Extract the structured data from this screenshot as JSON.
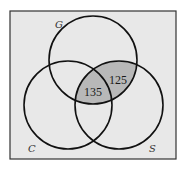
{
  "diagram": {
    "type": "venn",
    "background_color": "#e8e8e8",
    "shade_color": "#b8b8b8",
    "stroke_color": "#111111",
    "sets": [
      {
        "id": "G",
        "label": "G"
      },
      {
        "id": "C",
        "label": "C"
      },
      {
        "id": "S",
        "label": "S"
      }
    ],
    "regions": [
      {
        "sets": [
          "G",
          "S"
        ],
        "excluding": [
          "C"
        ],
        "value": "125",
        "shaded": true
      },
      {
        "sets": [
          "G",
          "C",
          "S"
        ],
        "value": "135",
        "shaded": true
      }
    ]
  }
}
